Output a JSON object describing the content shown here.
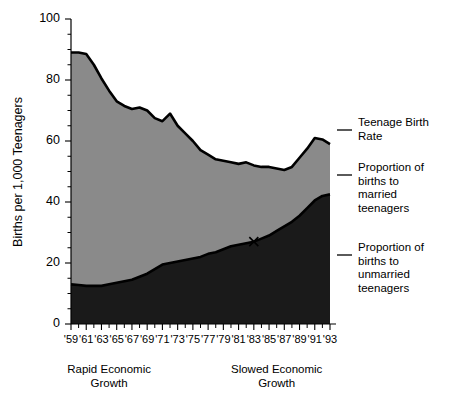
{
  "chart_data": {
    "type": "area",
    "title": "",
    "xlabel": "",
    "ylabel": "Births per 1,000 Teenagers",
    "ylim": [
      0,
      100
    ],
    "xlim": [
      1959,
      1993
    ],
    "grid": false,
    "legend_position": "right",
    "y_ticks": [
      0,
      20,
      40,
      60,
      80,
      100
    ],
    "y_tick_labels": [
      "0",
      "20",
      "40",
      "60",
      "80",
      "100"
    ],
    "y_minor_tick_step": 5,
    "x": [
      1959,
      1960,
      1961,
      1962,
      1963,
      1964,
      1965,
      1966,
      1967,
      1968,
      1969,
      1970,
      1971,
      1972,
      1973,
      1974,
      1975,
      1976,
      1977,
      1978,
      1979,
      1980,
      1981,
      1982,
      1983,
      1984,
      1985,
      1986,
      1987,
      1988,
      1989,
      1990,
      1991,
      1992,
      1993
    ],
    "x_tick_labels": [
      "'59",
      "'61",
      "'63",
      "'65",
      "'67",
      "'69",
      "'71",
      "'73",
      "'75",
      "'77",
      "'79",
      "'81",
      "'83",
      "'85",
      "'87",
      "'89",
      "'91",
      "'93"
    ],
    "x_tick_years": [
      1959,
      1961,
      1963,
      1965,
      1967,
      1969,
      1971,
      1973,
      1975,
      1977,
      1979,
      1981,
      1983,
      1985,
      1987,
      1989,
      1991,
      1993
    ],
    "series": [
      {
        "name": "Teenage Birth Rate",
        "role": "total",
        "color": "#8a8a8a",
        "values": [
          89,
          89,
          88.5,
          85,
          80.5,
          76.5,
          73,
          71.5,
          70.5,
          71,
          70,
          67.5,
          66.5,
          69,
          65,
          62.5,
          60,
          57,
          55.5,
          54,
          53.5,
          53,
          52.5,
          53,
          52,
          51.5,
          51.5,
          51,
          50.5,
          51.5,
          54.5,
          57.5,
          61,
          60.5,
          59
        ]
      },
      {
        "name": "Proportion of births to unmarried teenagers",
        "role": "unmarried",
        "color": "#1a1a1a",
        "values": [
          13,
          12.8,
          12.5,
          12.5,
          12.5,
          13,
          13.5,
          14,
          14.5,
          15.5,
          16.5,
          18,
          19.5,
          20,
          20.5,
          21,
          21.5,
          22,
          23,
          23.5,
          24.5,
          25.5,
          26,
          26.5,
          27,
          28,
          29,
          30.5,
          32,
          33.5,
          35.5,
          38,
          40.5,
          42,
          42.5
        ]
      }
    ],
    "band_between": {
      "name": "Proportion of births to married teenagers",
      "color": "#8a8a8a"
    },
    "markers": [
      {
        "name": "x-marker",
        "x": 1983,
        "y": 27,
        "symbol": "X"
      }
    ],
    "annotations": [
      {
        "name": "rapid-growth",
        "lines": [
          "Rapid Economic",
          "Growth"
        ],
        "x": 1964
      },
      {
        "name": "slowed-growth",
        "lines": [
          "Slowed Economic",
          "Growth"
        ],
        "x": 1986
      }
    ],
    "legend_entries": [
      {
        "name": "legend-total",
        "lines": [
          "Teenage Birth",
          "Rate"
        ]
      },
      {
        "name": "legend-married",
        "lines": [
          "Proportion of",
          "births to",
          "married",
          "teenagers"
        ]
      },
      {
        "name": "legend-unmarried",
        "lines": [
          "Proportion of",
          "births to",
          "unmarried",
          "teenagers"
        ]
      }
    ]
  },
  "colors": {
    "married_band": "#8a8a8a",
    "unmarried_band": "#1a1a1a",
    "line": "#000000",
    "background": "#ffffff"
  }
}
